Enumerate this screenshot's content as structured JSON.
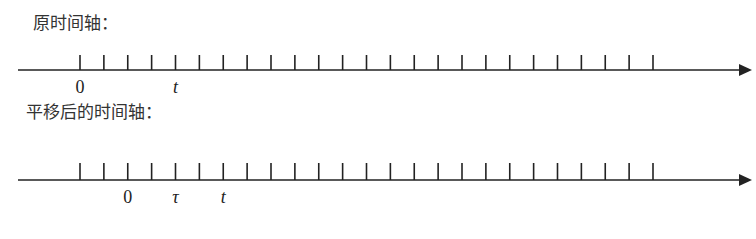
{
  "axes": [
    {
      "title": "原时间轴：",
      "axis_y": 70,
      "tick_top": 55,
      "labels": [
        {
          "text": "0",
          "tick_index": 0,
          "italic": false
        },
        {
          "text": "t",
          "tick_index": 4,
          "italic": true
        }
      ]
    },
    {
      "title": "平移后的时间轴：",
      "axis_y": 180,
      "tick_top": 163,
      "labels": [
        {
          "text": "0",
          "tick_index": 2,
          "italic": false
        },
        {
          "text": "τ",
          "tick_index": 4,
          "italic": true
        },
        {
          "text": "t",
          "tick_index": 6,
          "italic": true
        }
      ]
    }
  ],
  "tick_count": 25,
  "tick_start_x": 80,
  "tick_spacing": 23.875,
  "axis_start_x": 18,
  "axis_end_x": 752,
  "line_color": "#222222"
}
